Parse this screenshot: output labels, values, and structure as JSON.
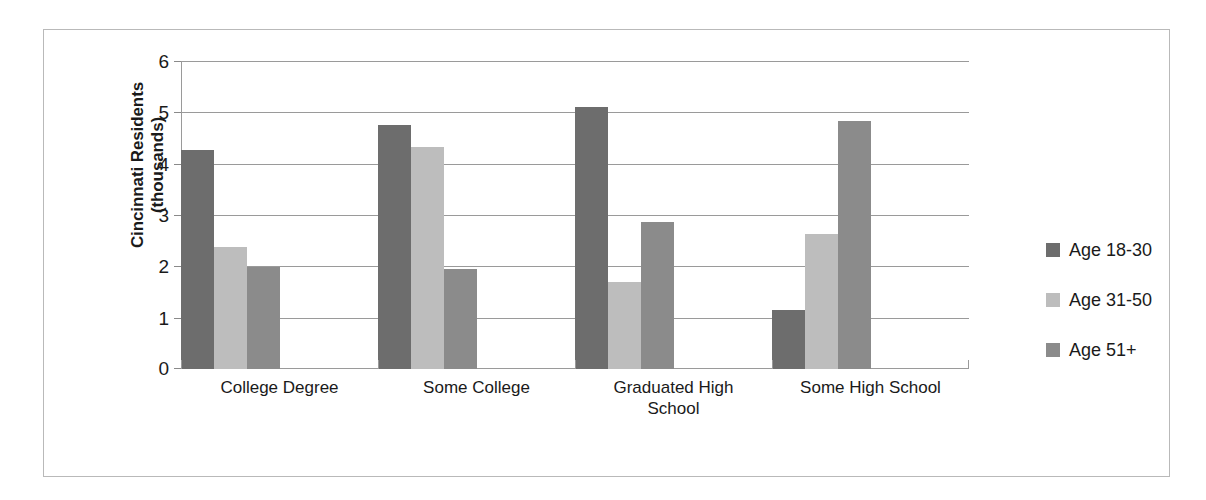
{
  "chart_data": {
    "type": "bar",
    "title": "",
    "xlabel": "",
    "ylabel": "Cincinnati Residents (thousands)",
    "ylabel_lines": [
      "Cincinnati Residents",
      "(thousands)"
    ],
    "categories": [
      "College Degree",
      "Some College",
      "Graduated High School",
      "Some High School"
    ],
    "category_lines": [
      [
        "College Degree"
      ],
      [
        "Some College"
      ],
      [
        "Graduated High",
        "School"
      ],
      [
        "Some High School"
      ]
    ],
    "series": [
      {
        "name": "Age 18-30",
        "color": "#6d6d6d",
        "values": [
          4.27,
          4.75,
          5.1,
          1.15
        ]
      },
      {
        "name": "Age 31-50",
        "color": "#bdbdbd",
        "values": [
          2.38,
          4.33,
          1.7,
          2.63
        ]
      },
      {
        "name": "Age 51+",
        "color": "#8b8b8b",
        "values": [
          1.98,
          1.95,
          2.87,
          4.83
        ]
      }
    ],
    "ylim": [
      0,
      6
    ],
    "yticks": [
      0,
      1,
      2,
      3,
      4,
      5,
      6
    ],
    "ytick_labels": [
      "0",
      "1",
      "2",
      "3",
      "4",
      "5",
      "6"
    ],
    "grid": true,
    "legend_position": "right",
    "frame_border_color": "#b9b9b9",
    "gridline_color": "#9a9a9a"
  }
}
